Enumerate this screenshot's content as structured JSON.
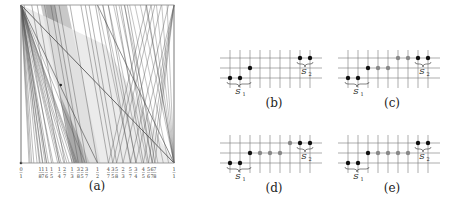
{
  "figure": {
    "panels": [
      {
        "id": "a",
        "caption": "(a)"
      },
      {
        "id": "b",
        "caption": "(b)"
      },
      {
        "id": "c",
        "caption": "(c)"
      },
      {
        "id": "d",
        "caption": "(d)"
      },
      {
        "id": "e",
        "caption": "(e)"
      }
    ]
  },
  "main_plot": {
    "x_tick_labels": [
      "0/1",
      "1/8",
      "1/7",
      "1/6",
      "1/5",
      "1/4",
      "2/7",
      "1/3",
      "3/8",
      "2/5",
      "3/7",
      "1/2",
      "4/7",
      "3/5",
      "5/8",
      "2/3",
      "5/7",
      "3/4",
      "4/5",
      "5/6",
      "6/7",
      "7/8",
      "1/1"
    ],
    "x_tick_values": [
      0,
      0.125,
      0.142857,
      0.166667,
      0.2,
      0.25,
      0.285714,
      0.333333,
      0.375,
      0.4,
      0.428571,
      0.5,
      0.571429,
      0.6,
      0.625,
      0.666667,
      0.714286,
      0.75,
      0.8,
      0.833333,
      0.857143,
      0.875,
      1
    ],
    "colors": {
      "frame": "#888888",
      "line": "#555555",
      "shade_dark": "#a8a8a8",
      "shade_mid": "#c8c8c8",
      "shade_light": "#e6e6e6"
    }
  },
  "grid_panels": [
    {
      "id": "b",
      "label_s1": "S",
      "sub1": "1",
      "label_s2": "S",
      "sub2": "2",
      "dots": [
        {
          "col": 0,
          "row": 2,
          "c": "black"
        },
        {
          "col": 1,
          "row": 2,
          "c": "black"
        },
        {
          "col": 2,
          "row": 1,
          "c": "black"
        },
        {
          "col": 7,
          "row": 0,
          "c": "black"
        },
        {
          "col": 8,
          "row": 0,
          "c": "black"
        }
      ]
    },
    {
      "id": "c",
      "label_s1": "S",
      "sub1": "1",
      "label_s2": "S",
      "sub2": "2",
      "dots": [
        {
          "col": 0,
          "row": 2,
          "c": "black"
        },
        {
          "col": 1,
          "row": 2,
          "c": "black"
        },
        {
          "col": 2,
          "row": 1,
          "c": "black"
        },
        {
          "col": 3,
          "row": 1,
          "c": "gray"
        },
        {
          "col": 4,
          "row": 1,
          "c": "gray"
        },
        {
          "col": 5,
          "row": 0,
          "c": "gray"
        },
        {
          "col": 6,
          "row": 0,
          "c": "gray"
        },
        {
          "col": 7,
          "row": 0,
          "c": "black"
        },
        {
          "col": 8,
          "row": 0,
          "c": "black"
        }
      ]
    },
    {
      "id": "d",
      "label_s1": "S",
      "sub1": "1",
      "label_s2": "S",
      "sub2": "2",
      "dots": [
        {
          "col": 0,
          "row": 2,
          "c": "black"
        },
        {
          "col": 1,
          "row": 2,
          "c": "black"
        },
        {
          "col": 2,
          "row": 1,
          "c": "black"
        },
        {
          "col": 3,
          "row": 1,
          "c": "gray"
        },
        {
          "col": 4,
          "row": 1,
          "c": "gray"
        },
        {
          "col": 5,
          "row": 1,
          "c": "gray"
        },
        {
          "col": 6,
          "row": 0,
          "c": "gray"
        },
        {
          "col": 7,
          "row": 0,
          "c": "black"
        },
        {
          "col": 8,
          "row": 0,
          "c": "black"
        }
      ]
    },
    {
      "id": "e",
      "label_s1": "S",
      "sub1": "1",
      "label_s2": "S",
      "sub2": "2",
      "dots": [
        {
          "col": 0,
          "row": 2,
          "c": "black"
        },
        {
          "col": 1,
          "row": 2,
          "c": "black"
        },
        {
          "col": 2,
          "row": 1,
          "c": "black"
        },
        {
          "col": 3,
          "row": 1,
          "c": "gray"
        },
        {
          "col": 4,
          "row": 1,
          "c": "gray"
        },
        {
          "col": 5,
          "row": 1,
          "c": "gray"
        },
        {
          "col": 6,
          "row": 1,
          "c": "gray"
        },
        {
          "col": 7,
          "row": 0,
          "c": "black"
        },
        {
          "col": 8,
          "row": 0,
          "c": "black"
        }
      ]
    }
  ]
}
